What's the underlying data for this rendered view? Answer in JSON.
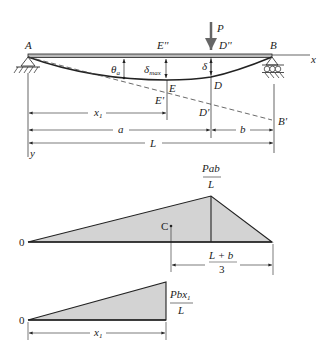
{
  "beam": {
    "labels": {
      "A": "A",
      "B": "B",
      "E2": "E''",
      "D2": "D''",
      "P": "P",
      "x_axis": "x",
      "y_axis": "y",
      "theta": "θ",
      "theta_sub": "a",
      "delta_max": "δ",
      "delta_max_sub": "max",
      "delta": "δ",
      "E": "E",
      "D": "D",
      "E1": "E'",
      "D1": "D'",
      "B1": "B'"
    },
    "dimensions": {
      "x1": "x",
      "x1_sub": "1",
      "a": "a",
      "b": "b",
      "L": "L"
    }
  },
  "moment_diagram": {
    "peak_num": "Pab",
    "peak_den": "L",
    "origin": "0",
    "centroid": "C",
    "centroid_dim_num": "L + b",
    "centroid_dim_den": "3"
  },
  "partial_diagram": {
    "origin": "0",
    "peak_num": "Pbx",
    "peak_num_sub": "1",
    "peak_den": "L",
    "dim": "x",
    "dim_sub": "1"
  },
  "colors": {
    "line": "#222222",
    "fill": "#d3d3d3",
    "dashed": "#444444"
  }
}
